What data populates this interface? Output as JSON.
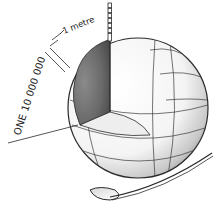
{
  "figure": {
    "label_fraction": "ONE 10 000 000",
    "label_unit": "1 metre",
    "colors": {
      "ink": "#2a2a2a",
      "shade_dark": "#5a5a5a",
      "shade_mid": "#9a9a9a",
      "background": "#ffffff"
    }
  }
}
